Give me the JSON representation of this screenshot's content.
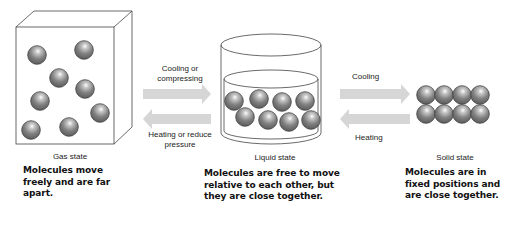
{
  "states": [
    {
      "title": "Gas state",
      "description": "Molecules move freely and are far apart."
    },
    {
      "title": "Liquid state",
      "description": "Molecules are free to move relative to each other, but they are close together."
    },
    {
      "title": "Solid state",
      "description": "Molecules are in fixed positions and are close together."
    }
  ],
  "transitions": {
    "gas_to_liquid": "Cooling or compressing",
    "liquid_to_gas": "Heating or reduce pressure",
    "liquid_to_solid": "Cooling",
    "solid_to_liquid": "Heating"
  },
  "colors": {
    "molecule": "#7a7a7a",
    "arrow": "#d6d6d6",
    "outline": "#333333"
  }
}
